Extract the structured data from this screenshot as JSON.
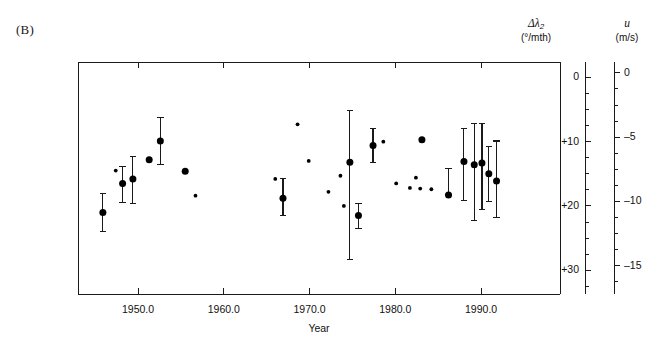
{
  "figure": {
    "panel_label": "(B)",
    "xaxis_title": "Year",
    "left_scale_symbol": "Δλ",
    "left_scale_sub": "2",
    "left_scale_unit": "(°/mth)",
    "right_scale_symbol": "u",
    "right_scale_unit": "(m/s)",
    "line_color": "#1a1a1a",
    "marker_color": "#000000"
  },
  "chart_data": {
    "type": "scatter",
    "title": "(B)",
    "xlabel": "Year",
    "ylabel": "Δλ2 (°/mth)",
    "y2label": "u (m/s)",
    "xlim": [
      1943.0,
      1999.2
    ],
    "ylim_left": [
      -2.4,
      33.7
    ],
    "ylim_right": [
      0.85,
      -17.2
    ],
    "y_inverted": true,
    "grid": false,
    "legend": null,
    "xticks": [
      1950.0,
      1960.0,
      1970.0,
      1980.0,
      1990.0
    ],
    "xtick_labels": [
      "1950.0",
      "1960.0",
      "1970.0",
      "1980.0",
      "1990.0"
    ],
    "yticks_left": [
      0,
      10,
      20,
      30
    ],
    "ytick_labels_left": [
      "0",
      "+10",
      "+20",
      "+30"
    ],
    "yticks_left_minor": [
      2.5,
      5,
      7.5,
      12.5,
      15,
      17.5,
      22.5,
      25,
      27.5,
      32.5
    ],
    "yticks_right": [
      0,
      -5,
      -10,
      -15
    ],
    "ytick_labels_right": [
      "0",
      "–5",
      "–10",
      "–15"
    ],
    "yticks_right_minor": [
      -1.25,
      -2.5,
      -3.75,
      -6.25,
      -7.5,
      -8.75,
      -11.25,
      -12.5,
      -13.75,
      -16.25
    ],
    "series": [
      {
        "name": "large-markers-with-error-bars",
        "marker": "filled-circle-large",
        "points": [
          {
            "x": 1945.9,
            "y": 21.0,
            "err_low": 24.0,
            "err_high": 18.0
          },
          {
            "x": 1948.2,
            "y": 16.5,
            "err_low": 19.5,
            "err_high": 13.8
          },
          {
            "x": 1949.4,
            "y": 15.8,
            "err_low": 19.6,
            "err_high": 12.3
          },
          {
            "x": 1951.3,
            "y": 12.8,
            "err_low": 12.8,
            "err_high": 12.8
          },
          {
            "x": 1952.6,
            "y": 9.9,
            "err_low": 13.6,
            "err_high": 6.3
          },
          {
            "x": 1955.5,
            "y": 14.6,
            "err_low": 14.6,
            "err_high": 14.6
          },
          {
            "x": 1966.9,
            "y": 18.8,
            "err_low": 21.5,
            "err_high": 15.7
          },
          {
            "x": 1974.7,
            "y": 13.2,
            "err_low": 28.4,
            "err_high": 5.1
          },
          {
            "x": 1975.7,
            "y": 21.5,
            "err_low": 23.5,
            "err_high": 19.6
          },
          {
            "x": 1977.4,
            "y": 10.6,
            "err_low": 13.3,
            "err_high": 8.0
          },
          {
            "x": 1983.1,
            "y": 9.7,
            "err_low": 9.7,
            "err_high": 9.7
          },
          {
            "x": 1986.2,
            "y": 18.3,
            "err_low": 18.3,
            "err_high": 14.2
          },
          {
            "x": 1988.0,
            "y": 13.1,
            "err_low": 19.1,
            "err_high": 7.9
          },
          {
            "x": 1989.2,
            "y": 13.6,
            "err_low": 22.2,
            "err_high": 7.2
          },
          {
            "x": 1990.1,
            "y": 13.3,
            "err_low": 20.5,
            "err_high": 7.1
          },
          {
            "x": 1990.9,
            "y": 15.0,
            "err_low": 19.3,
            "err_high": 10.7
          },
          {
            "x": 1991.8,
            "y": 16.1,
            "err_low": 21.8,
            "err_high": 9.9
          }
        ]
      },
      {
        "name": "small-markers",
        "marker": "filled-circle-small",
        "points": [
          {
            "x": 1947.4,
            "y": 14.5
          },
          {
            "x": 1956.7,
            "y": 18.4
          },
          {
            "x": 1968.6,
            "y": 7.3
          },
          {
            "x": 1969.9,
            "y": 13.0
          },
          {
            "x": 1966.0,
            "y": 15.8
          },
          {
            "x": 1972.2,
            "y": 17.8
          },
          {
            "x": 1973.6,
            "y": 15.3
          },
          {
            "x": 1974.0,
            "y": 20.0
          },
          {
            "x": 1978.6,
            "y": 10.0
          },
          {
            "x": 1980.1,
            "y": 16.5
          },
          {
            "x": 1981.7,
            "y": 17.2
          },
          {
            "x": 1982.4,
            "y": 15.6
          },
          {
            "x": 1982.9,
            "y": 17.3
          },
          {
            "x": 1984.2,
            "y": 17.4
          }
        ]
      }
    ]
  }
}
